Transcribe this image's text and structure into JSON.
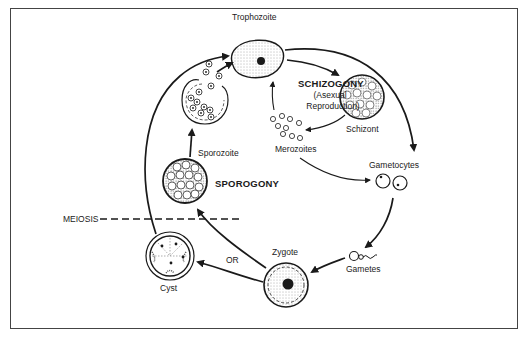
{
  "diagram": {
    "type": "life-cycle",
    "colors": {
      "ink": "#1a1a1a",
      "frame": "#444444",
      "background": "#ffffff"
    },
    "stages": {
      "trophozoite": "Trophozoite",
      "schizont": "Schizont",
      "merozoites": "Merozoites",
      "gametocytes": "Gametocytes",
      "gametes": "Gametes",
      "zygote": "Zygote",
      "cyst": "Cyst",
      "sporozoite": "Sporozoite"
    },
    "processes": {
      "schizogony": "SCHIZOGONY",
      "schizogony_note_1": "(Asexual",
      "schizogony_note_2": "Reproduction)",
      "sporogony": "SPOROGONY",
      "meiosis": "MEIOSIS",
      "or": "OR"
    },
    "edges": [
      [
        "Trophozoite",
        "Schizont"
      ],
      [
        "Schizont",
        "Merozoites"
      ],
      [
        "Merozoites",
        "Trophozoite"
      ],
      [
        "Merozoites",
        "Gametocytes"
      ],
      [
        "Trophozoite",
        "Gametocytes"
      ],
      [
        "Gametocytes",
        "Gametes"
      ],
      [
        "Gametes",
        "Zygote"
      ],
      [
        "Zygote",
        "Cyst"
      ],
      [
        "Zygote",
        "Sporogony"
      ],
      [
        "Cyst",
        "Trophozoite"
      ],
      [
        "Sporogony",
        "Sporozoite"
      ],
      [
        "Sporozoite",
        "Trophozoite"
      ]
    ]
  }
}
